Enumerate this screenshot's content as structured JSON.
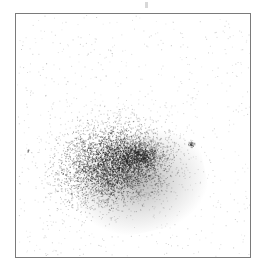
{
  "image": {
    "description": "Grayscale density scatter of a diffuse elliptical cluster inside a rectangular frame",
    "frame_color": "#7a7a7a",
    "background": "#ffffff",
    "cluster": {
      "cx": 112,
      "cy": 163,
      "rx": 52,
      "ry": 38,
      "rotation_deg": -12,
      "color": "#1e1e1e",
      "points": 4200
    },
    "secondary_core": {
      "cx": 138,
      "cy": 155,
      "rx": 22,
      "ry": 14,
      "points": 900
    },
    "compact_sources": [
      {
        "cx": 190,
        "cy": 143,
        "r": 3,
        "points": 40
      },
      {
        "cx": 27,
        "cy": 150,
        "r": 1.5,
        "points": 8
      }
    ],
    "background_noise_points": 700
  }
}
